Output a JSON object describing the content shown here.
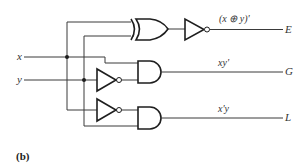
{
  "figure": {
    "caption": "(b)",
    "inputs": [
      {
        "name": "x",
        "label": "x"
      },
      {
        "name": "y",
        "label": "y"
      }
    ],
    "outputs": [
      {
        "name": "E",
        "label": "E",
        "expression": "(x ⊕ y)'"
      },
      {
        "name": "G",
        "label": "G",
        "expression": "xy'"
      },
      {
        "name": "L",
        "label": "L",
        "expression": "x'y"
      }
    ],
    "gates": [
      {
        "type": "XOR",
        "inputs": [
          "x",
          "y"
        ],
        "output": "x ⊕ y"
      },
      {
        "type": "NOT",
        "inputs": [
          "x ⊕ y"
        ],
        "output": "E"
      },
      {
        "type": "NOT",
        "inputs": [
          "y"
        ],
        "output": "y'"
      },
      {
        "type": "AND",
        "inputs": [
          "x",
          "y'"
        ],
        "output": "G"
      },
      {
        "type": "NOT",
        "inputs": [
          "x"
        ],
        "output": "x'"
      },
      {
        "type": "AND",
        "inputs": [
          "x'",
          "y"
        ],
        "output": "L"
      }
    ],
    "colors": {
      "line": "#3a3a3a",
      "gate_stroke": "#1e1e1e",
      "background": "#ffffff"
    }
  }
}
